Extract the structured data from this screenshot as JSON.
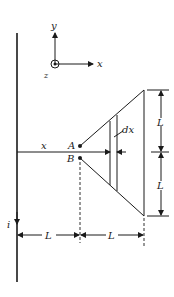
{
  "diagram": {
    "type": "physics-magnetostatics",
    "axes": {
      "x_label": "x",
      "y_label": "y",
      "z_label": "z",
      "z_direction": "out-of-page"
    },
    "wire": {
      "current_label": "i"
    },
    "points": {
      "a_label": "A",
      "b_label": "B"
    },
    "strip": {
      "width_label": "dx"
    },
    "distance_label": "x",
    "dimensions": {
      "right_upper": "L",
      "right_lower": "L",
      "bottom_left": "L",
      "bottom_right": "L"
    },
    "colors": {
      "ink": "#1a1a1a",
      "background": "#ffffff"
    }
  }
}
